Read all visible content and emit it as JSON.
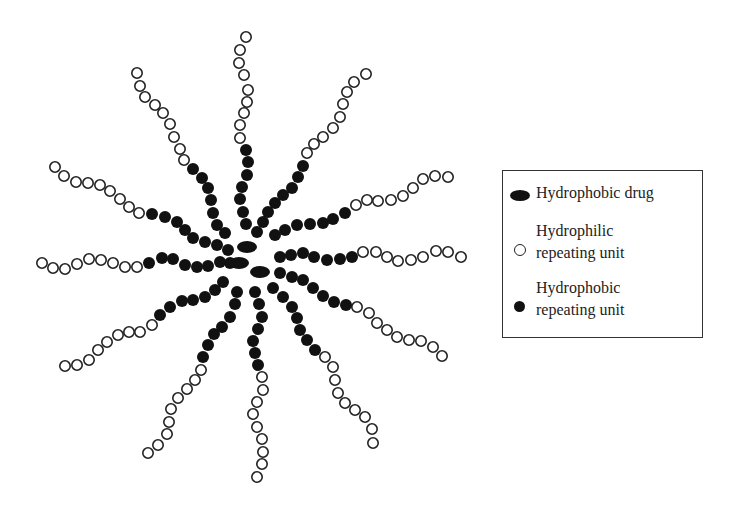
{
  "figure": {
    "colors": {
      "hydrophobic": "#111111",
      "hydrophilic_fill": "#ffffff",
      "hydrophilic_stroke": "#222222",
      "background": "#ffffff"
    },
    "bead_radius": 6,
    "drugs": [
      {
        "cx": 247,
        "cy": 247,
        "rx": 10,
        "ry": 6
      },
      {
        "cx": 239,
        "cy": 263,
        "rx": 10,
        "ry": 6
      },
      {
        "cx": 260,
        "cy": 272,
        "rx": 10,
        "ry": 6
      }
    ],
    "chains": [
      {
        "name": "chain-north",
        "hydrophobic": [
          [
            246,
            224
          ],
          [
            243,
            212
          ],
          [
            240,
            199
          ],
          [
            242,
            187
          ],
          [
            247,
            175
          ],
          [
            248,
            162
          ],
          [
            246,
            150
          ]
        ],
        "hydrophilic": [
          [
            240,
            138
          ],
          [
            240,
            125
          ],
          [
            244,
            113
          ],
          [
            247,
            102
          ],
          [
            248,
            90
          ],
          [
            244,
            75
          ],
          [
            239,
            63
          ],
          [
            240,
            50
          ],
          [
            246,
            37
          ]
        ]
      },
      {
        "name": "chain-north-west",
        "hydrophobic": [
          [
            225,
            233
          ],
          [
            217,
            225
          ],
          [
            213,
            213
          ],
          [
            211,
            200
          ],
          [
            208,
            188
          ],
          [
            202,
            178
          ],
          [
            193,
            169
          ]
        ],
        "hydrophilic": [
          [
            184,
            160
          ],
          [
            180,
            149
          ],
          [
            174,
            137
          ],
          [
            170,
            124
          ],
          [
            163,
            113
          ],
          [
            155,
            105
          ],
          [
            145,
            97
          ],
          [
            140,
            86
          ],
          [
            137,
            73
          ]
        ]
      },
      {
        "name": "chain-north-east",
        "hydrophobic": [
          [
            257,
            232
          ],
          [
            263,
            222
          ],
          [
            268,
            212
          ],
          [
            275,
            203
          ],
          [
            283,
            195
          ],
          [
            292,
            188
          ],
          [
            298,
            177
          ],
          [
            303,
            166
          ]
        ],
        "hydrophilic": [
          [
            307,
            153
          ],
          [
            314,
            144
          ],
          [
            323,
            137
          ],
          [
            333,
            128
          ],
          [
            340,
            117
          ],
          [
            343,
            104
          ],
          [
            347,
            92
          ],
          [
            354,
            82
          ],
          [
            366,
            74
          ]
        ]
      },
      {
        "name": "chain-east-north-east",
        "hydrophobic": [
          [
            275,
            235
          ],
          [
            285,
            230
          ],
          [
            297,
            225
          ],
          [
            310,
            224
          ],
          [
            323,
            223
          ],
          [
            333,
            219
          ],
          [
            345,
            213
          ]
        ],
        "hydrophilic": [
          [
            356,
            205
          ],
          [
            367,
            200
          ],
          [
            378,
            201
          ],
          [
            391,
            200
          ],
          [
            403,
            196
          ],
          [
            413,
            188
          ],
          [
            423,
            179
          ],
          [
            435,
            176
          ],
          [
            448,
            177
          ]
        ]
      },
      {
        "name": "chain-east",
        "hydrophobic": [
          [
            280,
            257
          ],
          [
            291,
            255
          ],
          [
            303,
            253
          ],
          [
            314,
            257
          ],
          [
            327,
            260
          ],
          [
            340,
            259
          ],
          [
            352,
            257
          ]
        ],
        "hydrophilic": [
          [
            363,
            252
          ],
          [
            376,
            252
          ],
          [
            387,
            257
          ],
          [
            398,
            261
          ],
          [
            411,
            260
          ],
          [
            423,
            257
          ],
          [
            436,
            251
          ],
          [
            448,
            252
          ],
          [
            461,
            257
          ]
        ]
      },
      {
        "name": "chain-east-south-east",
        "hydrophobic": [
          [
            280,
            273
          ],
          [
            292,
            277
          ],
          [
            303,
            280
          ],
          [
            313,
            288
          ],
          [
            323,
            296
          ],
          [
            334,
            302
          ],
          [
            346,
            305
          ]
        ],
        "hydrophilic": [
          [
            357,
            307
          ],
          [
            369,
            313
          ],
          [
            377,
            323
          ],
          [
            387,
            330
          ],
          [
            397,
            337
          ],
          [
            409,
            340
          ],
          [
            421,
            341
          ],
          [
            433,
            347
          ],
          [
            442,
            356
          ]
        ]
      },
      {
        "name": "chain-south-east",
        "hydrophobic": [
          [
            273,
            288
          ],
          [
            283,
            297
          ],
          [
            292,
            307
          ],
          [
            297,
            318
          ],
          [
            300,
            330
          ],
          [
            307,
            340
          ],
          [
            315,
            350
          ]
        ],
        "hydrophilic": [
          [
            325,
            357
          ],
          [
            333,
            367
          ],
          [
            335,
            380
          ],
          [
            338,
            393
          ],
          [
            345,
            403
          ],
          [
            355,
            410
          ],
          [
            365,
            417
          ],
          [
            372,
            429
          ],
          [
            373,
            443
          ]
        ]
      },
      {
        "name": "chain-south",
        "hydrophobic": [
          [
            255,
            292
          ],
          [
            259,
            304
          ],
          [
            262,
            317
          ],
          [
            258,
            329
          ],
          [
            253,
            341
          ],
          [
            255,
            353
          ],
          [
            258,
            365
          ]
        ],
        "hydrophilic": [
          [
            262,
            377
          ],
          [
            263,
            390
          ],
          [
            257,
            402
          ],
          [
            253,
            414
          ],
          [
            257,
            427
          ],
          [
            262,
            439
          ],
          [
            263,
            452
          ],
          [
            262,
            464
          ],
          [
            257,
            477
          ]
        ]
      },
      {
        "name": "chain-south-south-west",
        "hydrophobic": [
          [
            237,
            292
          ],
          [
            235,
            304
          ],
          [
            230,
            317
          ],
          [
            222,
            327
          ],
          [
            214,
            334
          ],
          [
            208,
            345
          ],
          [
            203,
            357
          ]
        ],
        "hydrophilic": [
          [
            201,
            370
          ],
          [
            195,
            380
          ],
          [
            187,
            389
          ],
          [
            178,
            398
          ],
          [
            171,
            409
          ],
          [
            169,
            422
          ],
          [
            167,
            434
          ],
          [
            158,
            445
          ],
          [
            148,
            453
          ]
        ]
      },
      {
        "name": "chain-south-west",
        "hydrophobic": [
          [
            223,
            282
          ],
          [
            215,
            290
          ],
          [
            205,
            297
          ],
          [
            193,
            300
          ],
          [
            182,
            301
          ],
          [
            170,
            307
          ],
          [
            160,
            315
          ]
        ],
        "hydrophilic": [
          [
            152,
            325
          ],
          [
            140,
            332
          ],
          [
            129,
            332
          ],
          [
            118,
            335
          ],
          [
            107,
            342
          ],
          [
            98,
            350
          ],
          [
            89,
            360
          ],
          [
            77,
            365
          ],
          [
            65,
            366
          ]
        ]
      },
      {
        "name": "chain-west",
        "hydrophobic": [
          [
            230,
            263
          ],
          [
            220,
            262
          ],
          [
            208,
            266
          ],
          [
            197,
            267
          ],
          [
            185,
            265
          ],
          [
            173,
            259
          ],
          [
            162,
            258
          ],
          [
            149,
            263
          ]
        ],
        "hydrophilic": [
          [
            137,
            267
          ],
          [
            125,
            267
          ],
          [
            113,
            263
          ],
          [
            101,
            260
          ],
          [
            89,
            259
          ],
          [
            77,
            264
          ],
          [
            65,
            269
          ],
          [
            53,
            268
          ],
          [
            42,
            263
          ]
        ]
      },
      {
        "name": "chain-west-north-west",
        "hydrophobic": [
          [
            228,
            250
          ],
          [
            217,
            245
          ],
          [
            205,
            242
          ],
          [
            193,
            238
          ],
          [
            185,
            230
          ],
          [
            177,
            222
          ],
          [
            165,
            217
          ],
          [
            152,
            214
          ]
        ],
        "hydrophilic": [
          [
            139,
            213
          ],
          [
            129,
            207
          ],
          [
            120,
            199
          ],
          [
            110,
            191
          ],
          [
            100,
            185
          ],
          [
            88,
            183
          ],
          [
            76,
            182
          ],
          [
            64,
            176
          ],
          [
            55,
            167
          ]
        ]
      }
    ]
  },
  "legend": {
    "items": [
      {
        "symbol": "drug-ellipse-icon",
        "label_lines": [
          "Hydrophobic drug"
        ]
      },
      {
        "symbol": "hollow-circle-icon",
        "label_lines": [
          "Hydrophilic",
          "repeating unit"
        ]
      },
      {
        "symbol": "filled-circle-icon",
        "label_lines": [
          "Hydrophobic",
          "repeating unit"
        ]
      }
    ],
    "item0_line0": "Hydrophobic drug",
    "item1_line0": "Hydrophilic",
    "item1_line1": "repeating unit",
    "item2_line0": "Hydrophobic",
    "item2_line1": "repeating unit"
  }
}
